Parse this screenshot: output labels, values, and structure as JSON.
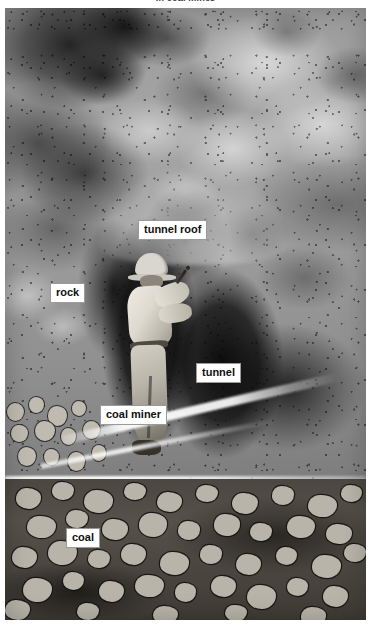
{
  "caption": {
    "text": "in coal mines",
    "note": "clipped by top edge of screenshot"
  },
  "illustration": {
    "title": "coal mine cross-section",
    "medium": "grayscale watercolor / wash painting",
    "scene": "A coal miner swinging a pickaxe inside a dark underground tunnel, surrounded by mottled rock walls, with broken coal rubble filling the foreground floor."
  },
  "labels": [
    {
      "id": "tunnel-roof",
      "text": "tunnel roof"
    },
    {
      "id": "rock",
      "text": "rock"
    },
    {
      "id": "tunnel",
      "text": "tunnel"
    },
    {
      "id": "coal-miner",
      "text": "coal miner"
    },
    {
      "id": "coal",
      "text": "coal"
    }
  ],
  "figure": {
    "helmet": "miner-helmet",
    "pickaxe": "pickaxe",
    "boot": "miner-boot"
  },
  "colors": {
    "label_background": "#ffffff",
    "label_border": "#9a9a9a",
    "label_text": "#101010",
    "page_background": "#ffffff",
    "rock_midtone": "#9b9b9b",
    "tunnel_dark": "#0a0a0a",
    "coal_rubble": "#4b4741",
    "rubble_chunk": "#b9b4a9",
    "light_streak": "#ffffff"
  }
}
